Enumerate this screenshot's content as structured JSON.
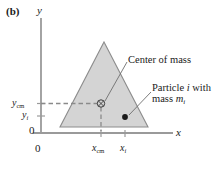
{
  "figure": {
    "panel_label": "(b)",
    "axes": {
      "y_name": "y",
      "x_name": "x",
      "origin_y_label": "0",
      "origin_x_label": "0"
    },
    "ticks": {
      "y": [
        {
          "name": "y-cm-tick",
          "base": "y",
          "sub": "cm",
          "sub_italic": false
        },
        {
          "name": "y-i-tick",
          "base": "y",
          "sub": "i",
          "sub_italic": true
        }
      ],
      "x": [
        {
          "name": "x-cm-tick",
          "base": "x",
          "sub": "cm",
          "sub_italic": false
        },
        {
          "name": "x-i-tick",
          "base": "x",
          "sub": "i",
          "sub_italic": true
        }
      ]
    },
    "annotations": {
      "center_of_mass": "Center of mass",
      "particle_line1_a": "Particle ",
      "particle_line1_i": "i",
      "particle_line1_b": " with",
      "particle_line2_a": "mass ",
      "particle_line2_m": "m",
      "particle_line2_sub": "i"
    },
    "markers": {
      "center_of_mass_symbol": "circled-cross-marker",
      "particle_symbol": "filled-dot-marker"
    },
    "colors": {
      "shape_fill": "#d4d4d4",
      "shape_stroke": "#8c8c8c",
      "axis": "#9a9a9a",
      "dashed_guide": "#8a8a8a",
      "text": "#1a1a1a",
      "leader_line": "#6e6e6e"
    },
    "geometry": {
      "triangle_apex": [
        104,
        42
      ],
      "triangle_left": [
        60,
        127
      ],
      "triangle_right": [
        148,
        127
      ],
      "center_of_mass_point": [
        101,
        104
      ],
      "particle_point": [
        125,
        117
      ]
    }
  }
}
